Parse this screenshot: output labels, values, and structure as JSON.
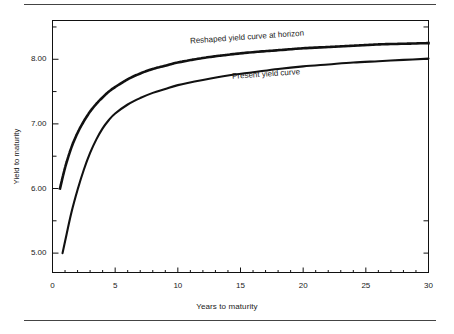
{
  "figure": {
    "background": "#ffffff",
    "ink_color": "#111111",
    "rule_color": "#444444"
  },
  "chart_data": {
    "type": "line",
    "title": "",
    "subtitle": "",
    "xlabel": "Years to maturity",
    "ylabel": "Yield to maturity",
    "xlim": [
      0,
      30
    ],
    "ylim": [
      4.7,
      8.6
    ],
    "grid": false,
    "legend_position": "inline-annotations",
    "xticks": [
      0,
      5,
      10,
      15,
      20,
      25,
      30
    ],
    "xtick_labels": [
      "0",
      "5",
      "10",
      "15",
      "20",
      "25",
      "30"
    ],
    "yticks": [
      5.0,
      6.0,
      7.0,
      8.0
    ],
    "ytick_labels": [
      "5.00",
      "6.00",
      "7.00",
      "8.00"
    ],
    "y_minor_ticks": [
      5.5,
      6.5,
      7.5,
      8.5
    ],
    "series": [
      {
        "name": "Present yield curve",
        "style": "solid",
        "annotation": "Present yield curve",
        "x": [
          0.8,
          1,
          1.5,
          2,
          2.5,
          3,
          3.5,
          4,
          4.5,
          5,
          6,
          7,
          8,
          9,
          10,
          12,
          14,
          16,
          18,
          20,
          22,
          24,
          26,
          28,
          30
        ],
        "y": [
          5.0,
          5.18,
          5.62,
          5.98,
          6.29,
          6.55,
          6.76,
          6.93,
          7.06,
          7.16,
          7.3,
          7.4,
          7.48,
          7.54,
          7.6,
          7.68,
          7.75,
          7.8,
          7.85,
          7.89,
          7.92,
          7.95,
          7.97,
          7.99,
          8.01
        ]
      },
      {
        "name": "Reshaped yield curve at horizon",
        "style": "dotted",
        "annotation": "Reshaped yield curve at horizon",
        "x": [
          0.6,
          1,
          1.5,
          2,
          2.5,
          3,
          3.5,
          4,
          4.5,
          5,
          6,
          7,
          8,
          9,
          10,
          12,
          14,
          16,
          18,
          20,
          22,
          24,
          26,
          28,
          30
        ],
        "y": [
          6.0,
          6.32,
          6.63,
          6.86,
          7.04,
          7.19,
          7.31,
          7.41,
          7.5,
          7.57,
          7.69,
          7.78,
          7.85,
          7.9,
          7.95,
          8.02,
          8.07,
          8.11,
          8.14,
          8.17,
          8.19,
          8.21,
          8.23,
          8.24,
          8.25
        ]
      }
    ],
    "annotations": [
      {
        "text": "Reshaped yield curve at horizon",
        "x": 15.5,
        "y": 8.35,
        "rotation": -4
      },
      {
        "text": "Present yield curve",
        "x": 17.0,
        "y": 7.78,
        "rotation": -4
      }
    ]
  }
}
